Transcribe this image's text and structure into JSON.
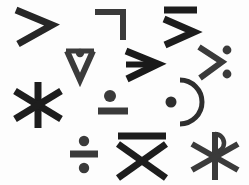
{
  "canvas": {
    "width": 249,
    "height": 185,
    "background_color": "#fdfdfd",
    "ink_color": "#2d2d2d",
    "ink_color_dark": "#1d1d1d",
    "description": "Sheet of twelve hand-drawn mathematical / symbolic glyphs arranged in four loose rows"
  },
  "glyphs": [
    {
      "id": "greater-than",
      "label": ">",
      "name": "greater-than-sign",
      "row": 1,
      "column": 1,
      "x": 12,
      "y": 6,
      "width": 48,
      "height": 40,
      "color": "#262626"
    },
    {
      "id": "not-sign-corner",
      "label": "¬",
      "name": "not-sign",
      "row": 1,
      "column": 2,
      "x": 93,
      "y": 8,
      "width": 34,
      "height": 34,
      "color": "#3a3a3a"
    },
    {
      "id": "greater-than-overbar",
      "label": "≥",
      "name": "greater-than-with-overbar",
      "row": 1,
      "column": 3,
      "x": 161,
      "y": 4,
      "width": 40,
      "height": 42,
      "color": "#1d1d1d"
    },
    {
      "id": "vee-with-dot",
      "label": "∨̇",
      "name": "vee-with-dot",
      "row": 2,
      "column": 1,
      "x": 63,
      "y": 46,
      "width": 34,
      "height": 36,
      "color": "#3b3b3b"
    },
    {
      "id": "right-arrow",
      "label": "➤",
      "name": "rightwards-arrow",
      "row": 2,
      "column": 2,
      "x": 124,
      "y": 48,
      "width": 42,
      "height": 32,
      "color": "#1a1a1a"
    },
    {
      "id": "greater-than-colon",
      "label": ">:",
      "name": "greater-than-with-two-dots",
      "row": 2,
      "column": 3,
      "x": 197,
      "y": 43,
      "width": 38,
      "height": 38,
      "color": "#3a3a3a"
    },
    {
      "id": "six-spoke-asterisk",
      "label": "✳",
      "name": "six-spoke-asterisk",
      "row": 3,
      "column": 1,
      "x": 10,
      "y": 80,
      "width": 54,
      "height": 48,
      "color": "#1d1d1d"
    },
    {
      "id": "dot-above-bar",
      "label": "∸",
      "name": "dot-above-bar",
      "row": 3,
      "column": 2,
      "x": 96,
      "y": 88,
      "width": 34,
      "height": 30,
      "color": "#3a3a3a"
    },
    {
      "id": "dot-with-paren",
      "label": ")",
      "name": "dot-with-right-parenthesis",
      "row": 3,
      "column": 3,
      "x": 160,
      "y": 77,
      "width": 42,
      "height": 48,
      "color": "#2e2e2e"
    },
    {
      "id": "division-sign",
      "label": "÷",
      "name": "division-sign",
      "row": 4,
      "column": 1,
      "x": 68,
      "y": 135,
      "width": 30,
      "height": 38,
      "color": "#3a3a3a"
    },
    {
      "id": "x-with-overbar",
      "label": "X̄",
      "name": "x-with-overbar",
      "row": 4,
      "column": 2,
      "x": 115,
      "y": 131,
      "width": 54,
      "height": 48,
      "color": "#1d1d1d"
    },
    {
      "id": "chi-rho",
      "label": "☧",
      "name": "chi-rho-symbol",
      "row": 4,
      "column": 3,
      "x": 186,
      "y": 128,
      "width": 56,
      "height": 54,
      "color": "#3a3a3a"
    }
  ]
}
